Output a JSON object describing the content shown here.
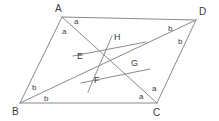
{
  "figure": {
    "canvas": {
      "width": 219,
      "height": 121,
      "background": "#ffffff"
    },
    "stroke_color": "#8a8a8a",
    "text_color": "#3b3b3b"
  },
  "vertices": [
    {
      "id": "A",
      "label": "A",
      "x": 62,
      "y": 17,
      "label_x": 55,
      "label_y": 4
    },
    {
      "id": "D",
      "label": "D",
      "x": 196,
      "y": 20,
      "label_x": 199,
      "label_y": 7
    },
    {
      "id": "B",
      "label": "B",
      "x": 20,
      "y": 103,
      "label_x": 12,
      "label_y": 107
    },
    {
      "id": "C",
      "label": "C",
      "x": 157,
      "y": 103,
      "label_x": 153,
      "label_y": 108
    }
  ],
  "interior_points": [
    {
      "id": "E",
      "label": "E",
      "x": 88,
      "y": 60,
      "label_x": 77,
      "label_y": 52
    },
    {
      "id": "F",
      "label": "F",
      "x": 96,
      "y": 79,
      "label_x": 94,
      "label_y": 76
    },
    {
      "id": "G",
      "label": "G",
      "x": 130,
      "y": 68,
      "label_x": 131,
      "label_y": 59
    },
    {
      "id": "H",
      "label": "H",
      "x": 116,
      "y": 48,
      "label_x": 114,
      "label_y": 33
    }
  ],
  "segments": [
    {
      "name": "side-AD",
      "from": "A",
      "to": "D",
      "x1": 62,
      "y1": 17,
      "x2": 196,
      "y2": 20
    },
    {
      "name": "side-AB",
      "from": "A",
      "to": "B",
      "x1": 62,
      "y1": 17,
      "x2": 20,
      "y2": 103
    },
    {
      "name": "side-BC",
      "from": "B",
      "to": "C",
      "x1": 20,
      "y1": 103,
      "x2": 157,
      "y2": 103
    },
    {
      "name": "side-DC",
      "from": "D",
      "to": "C",
      "x1": 196,
      "y1": 20,
      "x2": 157,
      "y2": 103
    },
    {
      "name": "diagonal-AC",
      "from": "A",
      "to": "C",
      "x1": 62,
      "y1": 17,
      "x2": 157,
      "y2": 103
    },
    {
      "name": "diagonal-BD",
      "from": "B",
      "to": "D",
      "x1": 20,
      "y1": 103,
      "x2": 196,
      "y2": 20
    },
    {
      "name": "transversal-upper",
      "from": "E",
      "to": "G",
      "x1": 73,
      "y1": 56,
      "x2": 146,
      "y2": 42
    },
    {
      "name": "transversal-lower",
      "from": "F",
      "to": "G",
      "x1": 81,
      "y1": 83,
      "x2": 150,
      "y2": 69
    },
    {
      "name": "transversal-HF",
      "from": "H",
      "to": "F",
      "x1": 112,
      "y1": 36,
      "x2": 88,
      "y2": 92
    }
  ],
  "angle_labels": [
    {
      "text": "a",
      "at_vertex": "A",
      "x": 74,
      "y": 18,
      "name": "angle-a-at-A-right"
    },
    {
      "text": "a",
      "at_vertex": "A",
      "x": 62,
      "y": 28,
      "name": "angle-a-at-A-left"
    },
    {
      "text": "b",
      "at_vertex": "D",
      "x": 168,
      "y": 25,
      "name": "angle-b-at-D-left"
    },
    {
      "text": "b",
      "at_vertex": "D",
      "x": 178,
      "y": 38,
      "name": "angle-b-at-D-right"
    },
    {
      "text": "b",
      "at_vertex": "B",
      "x": 32,
      "y": 84,
      "name": "angle-b-at-B-upper"
    },
    {
      "text": "b",
      "at_vertex": "B",
      "x": 44,
      "y": 95,
      "name": "angle-b-at-B-lower"
    },
    {
      "text": "a",
      "at_vertex": "C",
      "x": 139,
      "y": 93,
      "name": "angle-a-at-C-left"
    },
    {
      "text": "a",
      "at_vertex": "C",
      "x": 152,
      "y": 85,
      "name": "angle-a-at-C-right"
    }
  ]
}
